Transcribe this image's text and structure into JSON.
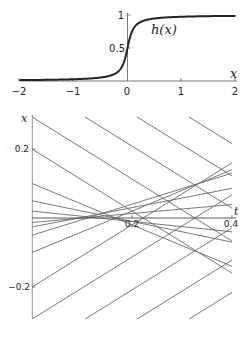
{
  "chart_data": [
    {
      "type": "line",
      "title": "",
      "xlabel": "x",
      "ylabel": "",
      "curve_label": "h(x)",
      "xlim": [
        -2,
        2
      ],
      "ylim": [
        0,
        1
      ],
      "x_ticks": [
        "-2",
        "-1",
        "0",
        "1",
        "2"
      ],
      "y_ticks": [
        "0.5",
        "1"
      ],
      "grid": false,
      "series": [
        {
          "name": "h(x)",
          "description": "sigmoid step, steep near x=0, approx h(x)=0.5+atan(12x)/pi",
          "x": [
            -2,
            -1.5,
            -1,
            -0.5,
            -0.25,
            -0.1,
            -0.05,
            0,
            0.05,
            0.1,
            0.25,
            0.5,
            1,
            1.5,
            2
          ],
          "values": [
            0.013,
            0.018,
            0.027,
            0.053,
            0.1,
            0.19,
            0.29,
            0.5,
            0.71,
            0.81,
            0.9,
            0.947,
            0.973,
            0.982,
            0.987
          ]
        }
      ],
      "color": "#222222"
    },
    {
      "type": "line",
      "title": "",
      "xlabel": "t",
      "ylabel": "x",
      "xlim": [
        0,
        0.4
      ],
      "ylim": [
        -0.29,
        0.29
      ],
      "x_ticks": [
        "0.2",
        "0.4"
      ],
      "y_ticks": [
        "0.2",
        "-0.2"
      ],
      "grid": false,
      "description": "straight characteristic lines x = x0 + v*(t - t0)",
      "series": [
        {
          "name": "c1",
          "t0": 0,
          "x0": 0.293,
          "v": -0.9
        },
        {
          "name": "c2",
          "t0": 0.106,
          "x0": 0.293,
          "v": -0.9
        },
        {
          "name": "c3",
          "t0": 0.21,
          "x0": 0.293,
          "v": -0.9
        },
        {
          "name": "c4",
          "t0": 0.314,
          "x0": 0.293,
          "v": -0.9
        },
        {
          "name": "c5",
          "t0": 0,
          "x0": 0.2,
          "v": -0.9
        },
        {
          "name": "c6",
          "t0": 0,
          "x0": 0.1,
          "v": -0.6
        },
        {
          "name": "c7",
          "t0": 0,
          "x0": 0.05,
          "v": -0.3
        },
        {
          "name": "c8",
          "t0": 0,
          "x0": 0.02,
          "v": -0.15
        },
        {
          "name": "c9",
          "t0": 0,
          "x0": -0.013,
          "v": 0.13
        },
        {
          "name": "c10",
          "t0": 0,
          "x0": -0.026,
          "v": 0.28
        },
        {
          "name": "c11",
          "t0": 0,
          "x0": -0.05,
          "v": 0.45
        },
        {
          "name": "c12",
          "t0": 0,
          "x0": -0.1,
          "v": 0.6
        },
        {
          "name": "c13",
          "t0": 0,
          "x0": -0.2,
          "v": 0.9
        },
        {
          "name": "c14",
          "t0": 0,
          "x0": -0.293,
          "v": 0.9
        },
        {
          "name": "c15",
          "t0": 0.106,
          "x0": -0.293,
          "v": 0.9
        },
        {
          "name": "c16",
          "t0": 0.21,
          "x0": -0.293,
          "v": 0.9
        },
        {
          "name": "c17",
          "t0": 0.314,
          "x0": -0.293,
          "v": 0.9
        }
      ],
      "color": "#666666"
    }
  ],
  "top": {
    "axis_label_x": "x",
    "curve_label": "h(x)",
    "ticks_x": [
      "−2",
      "−1",
      "0",
      "1",
      "2"
    ],
    "ticks_y": [
      "0.5",
      "1"
    ]
  },
  "bottom": {
    "axis_label_x": "t",
    "axis_label_y": "x",
    "ticks_t": [
      "0.2",
      "0.4"
    ],
    "ticks_x": [
      "0.2",
      "−0.2"
    ]
  }
}
